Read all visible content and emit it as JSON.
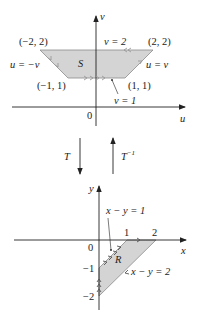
{
  "colors": {
    "region_fill": "#d4d4d4",
    "region_stroke": "#8c8c8c",
    "axis": "#222222",
    "boundary_arrow": "#9a9a9a"
  },
  "upper_plane": {
    "horizontal_axis_label": "u",
    "vertical_axis_label": "v",
    "origin_label": "0",
    "region_label": "S",
    "vertices": [
      {
        "label": "(−2, 2)",
        "u": -2,
        "v": 2
      },
      {
        "label": "(2, 2)",
        "u": 2,
        "v": 2
      },
      {
        "label": "(1, 1)",
        "u": 1,
        "v": 1
      },
      {
        "label": "(−1, 1)",
        "u": -1,
        "v": 1
      }
    ],
    "boundary_labels": {
      "top": "v = 2",
      "bottom": "v = 1",
      "left": "u = −v",
      "right": "u = v"
    }
  },
  "transform": {
    "forward_label": "T",
    "inverse_label": "T",
    "inverse_superscript": "−1"
  },
  "lower_plane": {
    "horizontal_axis_label": "x",
    "vertical_axis_label": "y",
    "origin_label": "0",
    "region_label": "R",
    "x_ticks": [
      "1",
      "2"
    ],
    "y_ticks": [
      "−1",
      "−2"
    ],
    "vertices": [
      {
        "x": 1,
        "y": 0
      },
      {
        "x": 2,
        "y": 0
      },
      {
        "x": 0,
        "y": -2
      },
      {
        "x": 0,
        "y": -1
      }
    ],
    "boundary_labels": {
      "upper": "x − y = 1",
      "lower": "x − y = 2"
    }
  }
}
